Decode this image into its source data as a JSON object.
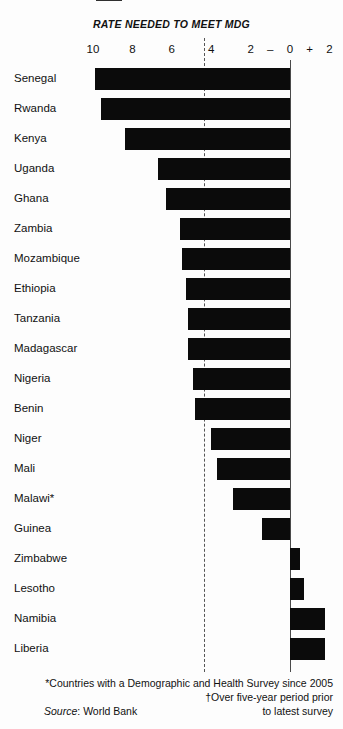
{
  "chart_data": {
    "type": "bar",
    "title": "",
    "subtitle": "RATE NEEDED TO MEET MDG",
    "orientation": "horizontal",
    "xlabel": "",
    "ylabel": "",
    "xlim": [
      10,
      -2
    ],
    "x_tick_labels": [
      "10",
      "8",
      "6",
      "4",
      "2",
      "–",
      "0",
      "+",
      "2"
    ],
    "x_tick_values": [
      10,
      8,
      6,
      4,
      2,
      1,
      0,
      -1,
      -2
    ],
    "grid": false,
    "legend": null,
    "reference_line": {
      "name": "rate-needed-to-meet-mdg",
      "value": 4.35,
      "style": "dashed",
      "label": "RATE NEEDED TO MEET MDG"
    },
    "categories": [
      "Senegal",
      "Rwanda",
      "Kenya",
      "Uganda",
      "Ghana",
      "Zambia",
      "Mozambique",
      "Ethiopia",
      "Tanzania",
      "Madagascar",
      "Nigeria",
      "Benin",
      "Niger",
      "Mali",
      "Malawi*",
      "Guinea",
      "Zimbabwe",
      "Lesotho",
      "Namibia",
      "Liberia"
    ],
    "values": [
      9.9,
      9.6,
      8.4,
      6.7,
      6.3,
      5.6,
      5.5,
      5.3,
      5.2,
      5.2,
      4.9,
      4.8,
      4.0,
      3.7,
      2.9,
      1.4,
      -0.5,
      -0.7,
      -1.8,
      -1.8
    ],
    "bars": [
      {
        "label": "Senegal",
        "value": 9.9,
        "direction": "negative-decline"
      },
      {
        "label": "Rwanda",
        "value": 9.6,
        "direction": "negative-decline"
      },
      {
        "label": "Kenya",
        "value": 8.4,
        "direction": "negative-decline"
      },
      {
        "label": "Uganda",
        "value": 6.7,
        "direction": "negative-decline"
      },
      {
        "label": "Ghana",
        "value": 6.3,
        "direction": "negative-decline"
      },
      {
        "label": "Zambia",
        "value": 5.6,
        "direction": "negative-decline"
      },
      {
        "label": "Mozambique",
        "value": 5.5,
        "direction": "negative-decline"
      },
      {
        "label": "Ethiopia",
        "value": 5.3,
        "direction": "negative-decline"
      },
      {
        "label": "Tanzania",
        "value": 5.2,
        "direction": "negative-decline"
      },
      {
        "label": "Madagascar",
        "value": 5.2,
        "direction": "negative-decline"
      },
      {
        "label": "Nigeria",
        "value": 4.9,
        "direction": "negative-decline"
      },
      {
        "label": "Benin",
        "value": 4.8,
        "direction": "negative-decline"
      },
      {
        "label": "Niger",
        "value": 4.0,
        "direction": "negative-decline"
      },
      {
        "label": "Mali",
        "value": 3.7,
        "direction": "negative-decline"
      },
      {
        "label": "Malawi*",
        "value": 2.9,
        "direction": "negative-decline"
      },
      {
        "label": "Guinea",
        "value": 1.4,
        "direction": "negative-decline"
      },
      {
        "label": "Zimbabwe",
        "value": -0.5,
        "direction": "positive-increase"
      },
      {
        "label": "Lesotho",
        "value": -0.7,
        "direction": "positive-increase"
      },
      {
        "label": "Namibia",
        "value": -1.8,
        "direction": "positive-increase"
      },
      {
        "label": "Liberia",
        "value": -1.8,
        "direction": "positive-increase"
      }
    ],
    "bar_color": "#0b0b0b",
    "axis_color": "#4a4a4a"
  },
  "footnotes": {
    "note_asterisk": "*Countries with a Demographic and Health Survey since 2005",
    "note_dagger": "†Over five-year period prior",
    "note_dagger_cont": "to latest survey",
    "source_label": "Source",
    "source_sep": ": ",
    "source_value": "World Bank"
  }
}
